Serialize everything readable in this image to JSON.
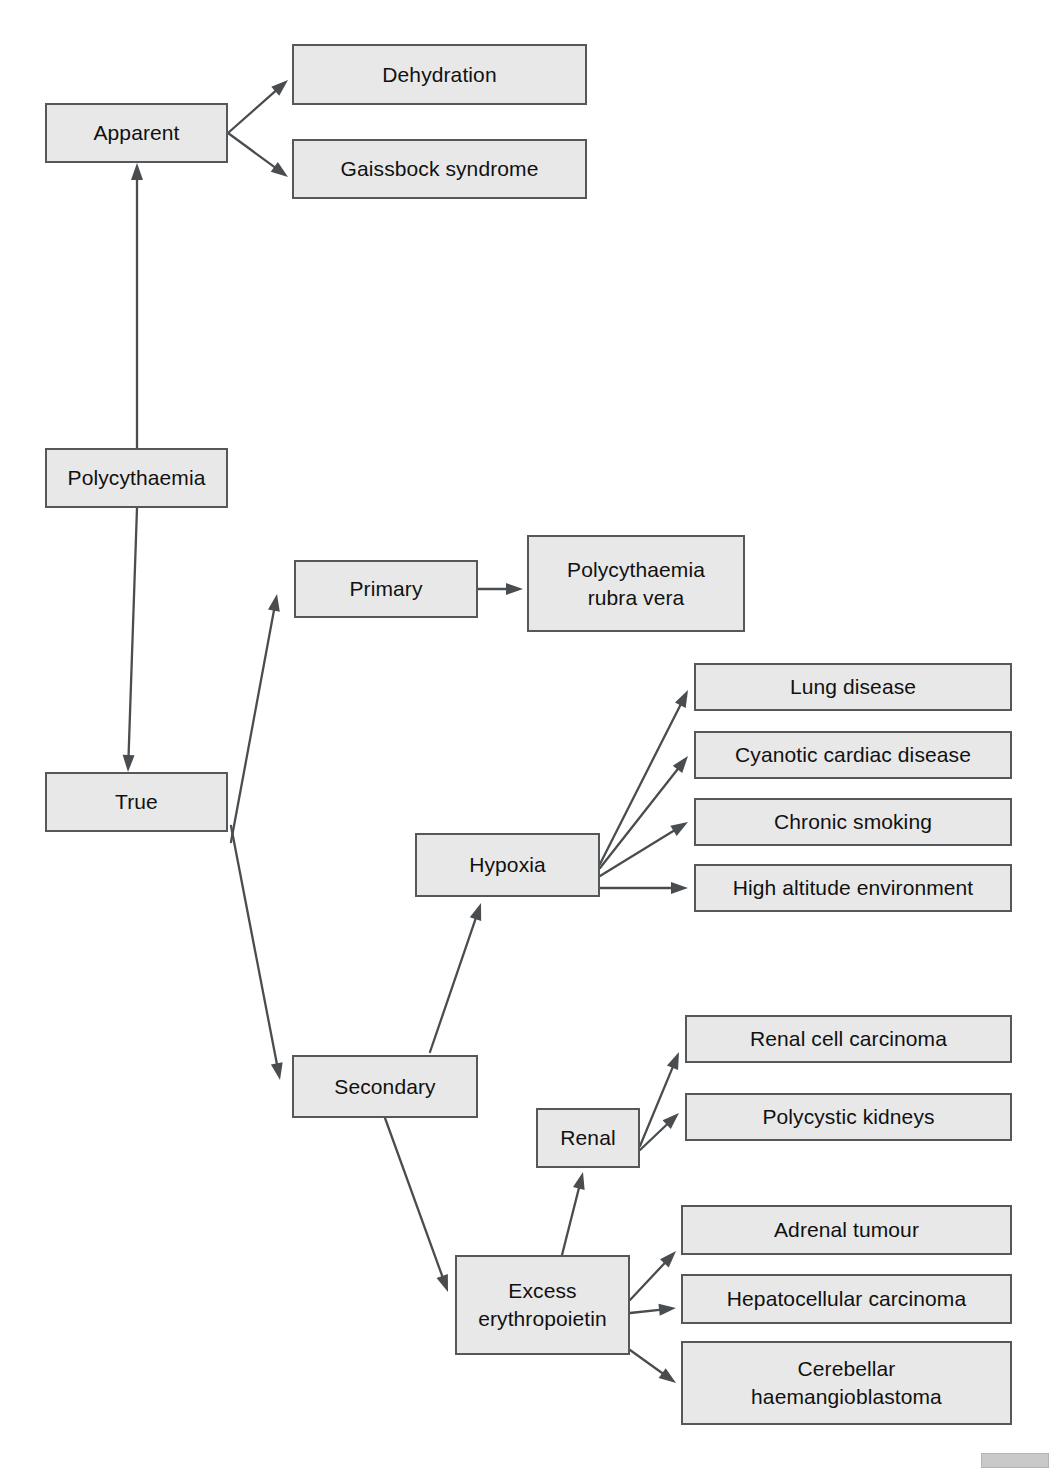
{
  "diagram": {
    "type": "flowchart",
    "box_fill": "#e8e8e8",
    "box_border": "#55585a",
    "edge_color": "#4a4d4f",
    "text_color": "#111111",
    "background": "#ffffff",
    "artifacts": {
      "top_text": "",
      "corner_note": ""
    },
    "nodes": [
      {
        "id": "polycythaemia",
        "label": "Polycythaemia",
        "x": 45,
        "y": 448,
        "w": 183,
        "h": 60,
        "font": 21
      },
      {
        "id": "apparent",
        "label": "Apparent",
        "x": 45,
        "y": 103,
        "w": 183,
        "h": 60,
        "font": 21
      },
      {
        "id": "dehydration",
        "label": "Dehydration",
        "x": 292,
        "y": 44,
        "w": 295,
        "h": 61,
        "font": 21
      },
      {
        "id": "gaissbock",
        "label": "Gaissbock syndrome",
        "x": 292,
        "y": 139,
        "w": 295,
        "h": 60,
        "font": 21
      },
      {
        "id": "true",
        "label": "True",
        "x": 45,
        "y": 772,
        "w": 183,
        "h": 60,
        "font": 21
      },
      {
        "id": "primary",
        "label": "Primary",
        "x": 294,
        "y": 560,
        "w": 184,
        "h": 58,
        "font": 21
      },
      {
        "id": "prv",
        "label": "Polycythaemia\nrubra vera",
        "x": 527,
        "y": 535,
        "w": 218,
        "h": 97,
        "font": 21
      },
      {
        "id": "secondary",
        "label": "Secondary",
        "x": 292,
        "y": 1055,
        "w": 186,
        "h": 63,
        "font": 21
      },
      {
        "id": "hypoxia",
        "label": "Hypoxia",
        "x": 415,
        "y": 833,
        "w": 185,
        "h": 64,
        "font": 21
      },
      {
        "id": "lung",
        "label": "Lung disease",
        "x": 694,
        "y": 663,
        "w": 318,
        "h": 48,
        "font": 21
      },
      {
        "id": "cyanotic",
        "label": "Cyanotic cardiac disease",
        "x": 694,
        "y": 731,
        "w": 318,
        "h": 48,
        "font": 21
      },
      {
        "id": "smoking",
        "label": "Chronic smoking",
        "x": 694,
        "y": 798,
        "w": 318,
        "h": 48,
        "font": 21
      },
      {
        "id": "altitude",
        "label": "High altitude environment",
        "x": 694,
        "y": 864,
        "w": 318,
        "h": 48,
        "font": 21
      },
      {
        "id": "renal",
        "label": "Renal",
        "x": 536,
        "y": 1108,
        "w": 104,
        "h": 60,
        "font": 21
      },
      {
        "id": "rcc",
        "label": "Renal cell carcinoma",
        "x": 685,
        "y": 1015,
        "w": 327,
        "h": 48,
        "font": 21
      },
      {
        "id": "polycystic",
        "label": "Polycystic kidneys",
        "x": 685,
        "y": 1093,
        "w": 327,
        "h": 48,
        "font": 21
      },
      {
        "id": "excess_epo",
        "label": "Excess\nerythropoietin",
        "x": 455,
        "y": 1255,
        "w": 175,
        "h": 100,
        "font": 21
      },
      {
        "id": "adrenal",
        "label": "Adrenal tumour",
        "x": 681,
        "y": 1205,
        "w": 331,
        "h": 50,
        "font": 21
      },
      {
        "id": "hepatocellular",
        "label": "Hepatocellular carcinoma",
        "x": 681,
        "y": 1274,
        "w": 331,
        "h": 50,
        "font": 21
      },
      {
        "id": "cerebellar",
        "label": "Cerebellar\nhaemangioblastoma",
        "x": 681,
        "y": 1341,
        "w": 331,
        "h": 84,
        "font": 21
      }
    ],
    "edges": [
      {
        "id": "polycythaemia-apparent",
        "from": "polycythaemia",
        "to": "apparent",
        "x1": 137,
        "y1": 448,
        "x2": 137,
        "y2": 163,
        "arrow_start": false,
        "arrow_end": true
      },
      {
        "id": "polycythaemia-true",
        "from": "polycythaemia",
        "to": "true",
        "x1": 137,
        "y1": 508,
        "x2": 128,
        "y2": 772,
        "arrow_start": false,
        "arrow_end": true
      },
      {
        "id": "apparent-dehydration",
        "from": "apparent",
        "to": "dehydration",
        "x1": 228,
        "y1": 133,
        "x2": 288,
        "y2": 80,
        "arrow_start": false,
        "arrow_end": true
      },
      {
        "id": "apparent-gaissbock",
        "from": "apparent",
        "to": "gaissbock",
        "x1": 228,
        "y1": 133,
        "x2": 288,
        "y2": 177,
        "arrow_start": false,
        "arrow_end": true
      },
      {
        "id": "true-primary",
        "from": "true",
        "to": "primary",
        "x1": 231,
        "y1": 842,
        "x2": 277,
        "y2": 594,
        "arrow_start": false,
        "arrow_end": true
      },
      {
        "id": "true-secondary",
        "from": "true",
        "to": "secondary",
        "x1": 231,
        "y1": 826,
        "x2": 280,
        "y2": 1080,
        "arrow_start": false,
        "arrow_end": true
      },
      {
        "id": "primary-prv",
        "from": "primary",
        "to": "prv",
        "x1": 478,
        "y1": 589,
        "x2": 523,
        "y2": 589,
        "arrow_start": false,
        "arrow_end": true
      },
      {
        "id": "secondary-hypoxia",
        "from": "secondary",
        "to": "hypoxia",
        "x1": 430,
        "y1": 1052,
        "x2": 481,
        "y2": 903,
        "arrow_start": false,
        "arrow_end": true
      },
      {
        "id": "secondary-excess",
        "from": "secondary",
        "to": "excess_epo",
        "x1": 385,
        "y1": 1118,
        "x2": 448,
        "y2": 1292,
        "arrow_start": false,
        "arrow_end": true
      },
      {
        "id": "hypoxia-lung",
        "from": "hypoxia",
        "to": "lung",
        "x1": 600,
        "y1": 864,
        "x2": 688,
        "y2": 690,
        "arrow_start": false,
        "arrow_end": true
      },
      {
        "id": "hypoxia-cyanotic",
        "from": "hypoxia",
        "to": "cyanotic",
        "x1": 600,
        "y1": 868,
        "x2": 688,
        "y2": 756,
        "arrow_start": false,
        "arrow_end": true
      },
      {
        "id": "hypoxia-smoking",
        "from": "hypoxia",
        "to": "smoking",
        "x1": 600,
        "y1": 876,
        "x2": 688,
        "y2": 822,
        "arrow_start": false,
        "arrow_end": true
      },
      {
        "id": "hypoxia-altitude",
        "from": "hypoxia",
        "to": "altitude",
        "x1": 600,
        "y1": 888,
        "x2": 688,
        "y2": 888,
        "arrow_start": false,
        "arrow_end": true
      },
      {
        "id": "excess-renal",
        "from": "excess_epo",
        "to": "renal",
        "x1": 562,
        "y1": 1255,
        "x2": 583,
        "y2": 1172,
        "arrow_start": false,
        "arrow_end": true
      },
      {
        "id": "renal-rcc",
        "from": "renal",
        "to": "rcc",
        "x1": 640,
        "y1": 1146,
        "x2": 679,
        "y2": 1052,
        "arrow_start": false,
        "arrow_end": true
      },
      {
        "id": "renal-polycystic",
        "from": "renal",
        "to": "polycystic",
        "x1": 640,
        "y1": 1150,
        "x2": 679,
        "y2": 1113,
        "arrow_start": false,
        "arrow_end": true
      },
      {
        "id": "excess-adrenal",
        "from": "excess_epo",
        "to": "adrenal",
        "x1": 630,
        "y1": 1300,
        "x2": 676,
        "y2": 1251,
        "arrow_start": false,
        "arrow_end": true
      },
      {
        "id": "excess-hepatocellular",
        "from": "excess_epo",
        "to": "hepatocellular",
        "x1": 630,
        "y1": 1313,
        "x2": 676,
        "y2": 1308,
        "arrow_start": false,
        "arrow_end": true
      },
      {
        "id": "excess-cerebellar",
        "from": "excess_epo",
        "to": "cerebellar",
        "x1": 630,
        "y1": 1350,
        "x2": 676,
        "y2": 1383,
        "arrow_start": false,
        "arrow_end": true
      }
    ]
  }
}
